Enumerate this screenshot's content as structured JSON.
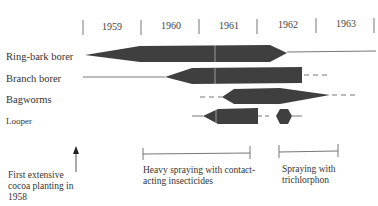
{
  "timeline": {
    "years": [
      "1959",
      "1960",
      "1961",
      "1962",
      "1963"
    ],
    "tick_x": [
      83,
      141,
      199,
      257,
      316,
      375
    ],
    "year_center_x": [
      112,
      170,
      229,
      288,
      346
    ]
  },
  "rows": [
    {
      "label": "Ring-bark borer",
      "y": 53
    },
    {
      "label": "Branch borer",
      "y": 77
    },
    {
      "label": "Bagworms",
      "y": 97
    },
    {
      "label": "Looper",
      "y": 116
    }
  ],
  "annotations": {
    "first_planting": "First extensive cocoa planting in 1958",
    "heavy_spraying": "Heavy spraying with contact-acting insecticides",
    "trichlorphon": "Spraying with trichlorphon"
  },
  "colors": {
    "bar_fill": "#3f3f3f",
    "line": "#555555",
    "text": "#333333"
  }
}
